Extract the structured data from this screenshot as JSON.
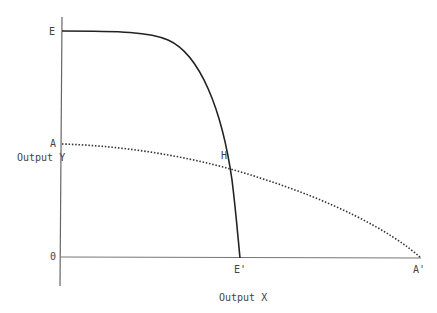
{
  "diagram": {
    "type": "production-possibility-frontiers",
    "axes": {
      "y_label": "Output Y",
      "x_label": "Output X",
      "origin_label": "0"
    },
    "points": {
      "E": "E",
      "A": "A",
      "H": "H",
      "E_prime": "E'",
      "A_prime": "A'"
    },
    "curves": [
      {
        "name": "EE'",
        "style": "solid",
        "from": "E",
        "to": "E'",
        "color": "#222222"
      },
      {
        "name": "AA'",
        "style": "dotted",
        "from": "A",
        "to": "A'",
        "color": "#333333"
      }
    ],
    "intersection": "H"
  }
}
